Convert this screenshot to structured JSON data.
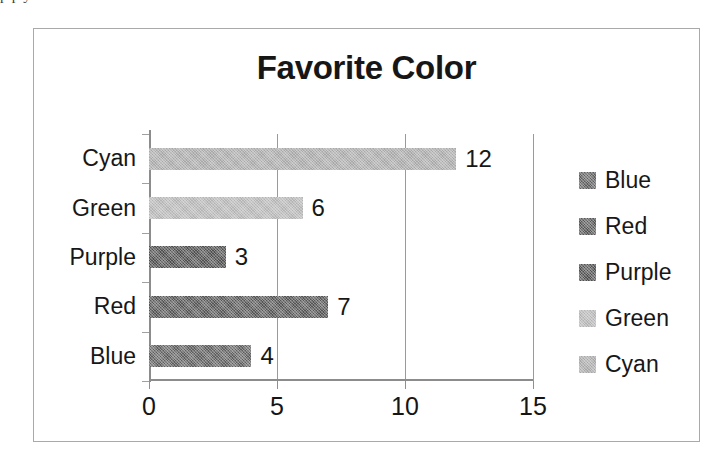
{
  "page": {
    "top_cut_text": "p                    p                                                           y"
  },
  "chart_data": {
    "type": "bar",
    "orientation": "horizontal",
    "title": "Favorite Color",
    "xlabel": "",
    "ylabel": "",
    "categories": [
      "Blue",
      "Red",
      "Purple",
      "Green",
      "Cyan"
    ],
    "values": [
      4,
      7,
      3,
      6,
      12
    ],
    "data_labels": [
      "4",
      "7",
      "3",
      "6",
      "12"
    ],
    "colors": [
      "#5e5e5e",
      "#555555",
      "#4f4f4f",
      "#b4b4b4",
      "#a8a8a8"
    ],
    "xlim": [
      0,
      15
    ],
    "xticks": [
      0,
      5,
      10,
      15
    ],
    "xtick_labels": [
      "0",
      "5",
      "10",
      "15"
    ],
    "grid": "vertical",
    "legend": {
      "position": "right",
      "entries": [
        {
          "label": "Blue",
          "color": "#5e5e5e"
        },
        {
          "label": "Red",
          "color": "#555555"
        },
        {
          "label": "Purple",
          "color": "#4f4f4f"
        },
        {
          "label": "Green",
          "color": "#b4b4b4"
        },
        {
          "label": "Cyan",
          "color": "#a8a8a8"
        }
      ]
    },
    "display_order_top_to_bottom": [
      "Cyan",
      "Green",
      "Purple",
      "Red",
      "Blue"
    ]
  }
}
